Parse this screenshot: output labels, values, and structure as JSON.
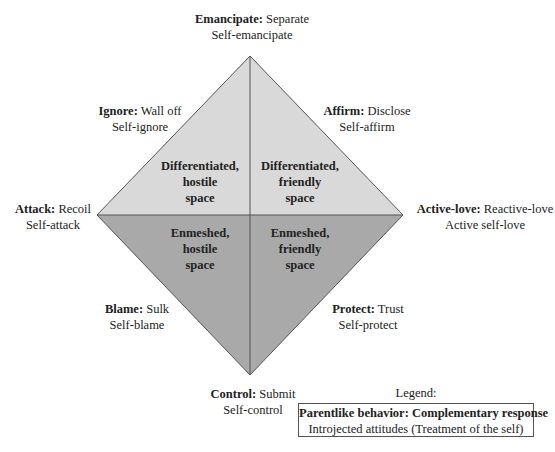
{
  "colors": {
    "upper_fill": "#d9d9d9",
    "lower_fill": "#a9a9a9",
    "line": "#555555",
    "text": "#222222"
  },
  "diamond": {
    "top": [
      250,
      56
    ],
    "right": [
      403,
      215
    ],
    "bottom": [
      250,
      375
    ],
    "left": [
      97,
      215
    ]
  },
  "poles": {
    "top": {
      "bold": "Emancipate:",
      "rest": " Separate",
      "line2": "Self-emancipate"
    },
    "upper_left": {
      "bold": "Ignore:",
      "rest": " Wall off",
      "line2": "Self-ignore"
    },
    "upper_right": {
      "bold": "Affirm:",
      "rest": " Disclose",
      "line2": "Self-affirm"
    },
    "left": {
      "bold": "Attack:",
      "rest": " Recoil",
      "line2": "Self-attack"
    },
    "right": {
      "bold": "Active-love:",
      "rest": " Reactive-love",
      "line2": "Active self-love"
    },
    "lower_left": {
      "bold": "Blame:",
      "rest": " Sulk",
      "line2": "Self-blame"
    },
    "lower_right": {
      "bold": "Protect:",
      "rest": " Trust",
      "line2": "Self-protect"
    },
    "bottom": {
      "bold": "Control:",
      "rest": " Submit",
      "line2": "Self-control"
    }
  },
  "regions": {
    "upper_left": [
      "Differentiated,",
      "hostile",
      "space"
    ],
    "upper_right": [
      "Differentiated,",
      "friendly",
      "space"
    ],
    "lower_left": [
      "Enmeshed,",
      "hostile",
      "space"
    ],
    "lower_right": [
      "Enmeshed,",
      "friendly",
      "space"
    ]
  },
  "legend": {
    "title": "Legend:",
    "line1": "Parentlike behavior: Complementary response",
    "line2": "Introjected attitudes (Treatment of the self)"
  }
}
